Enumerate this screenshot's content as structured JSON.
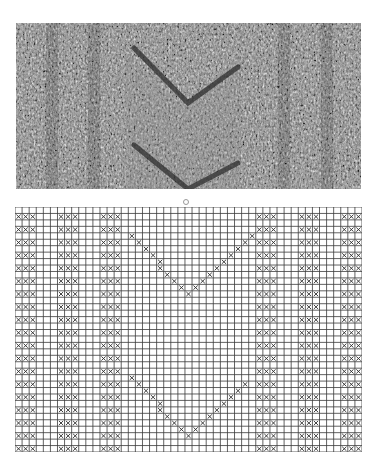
{
  "figure": {
    "photo": {
      "description": "Knitted swatch photograph showing two stacked V / chevron shapes flanked by vertical textured rib columns",
      "motif": "double V chevron"
    },
    "label_mark": "o",
    "chart": {
      "columns": 49,
      "rows": 38,
      "symbol": "x",
      "line_color": "#3a3a3a",
      "symbol_color": "#2a2a2a",
      "rib_groups": [
        {
          "start_col": 0,
          "width": 3
        },
        {
          "start_col": 6,
          "width": 3
        },
        {
          "start_col": 12,
          "width": 3
        },
        {
          "start_col": 34,
          "width": 3
        },
        {
          "start_col": 40,
          "width": 3
        },
        {
          "start_col": 46,
          "width": 3
        }
      ],
      "rib_rows": "every other row starting at row 1",
      "v_shapes": [
        {
          "left_top": {
            "col": 16,
            "row": 4
          },
          "bottom": {
            "col": 24,
            "row": 13
          },
          "right_top": {
            "col": 33,
            "row": 4
          }
        },
        {
          "left_top": {
            "col": 16,
            "row": 26
          },
          "bottom": {
            "col": 24,
            "row": 35
          },
          "right_top": {
            "col": 32,
            "row": 27
          }
        }
      ]
    }
  }
}
